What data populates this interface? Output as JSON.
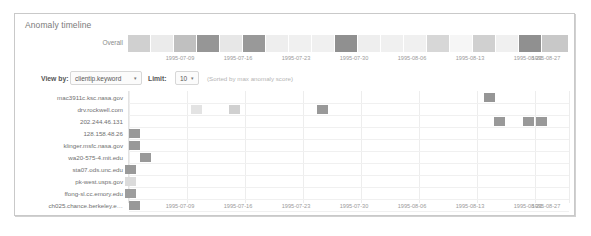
{
  "panel": {
    "title": "Anomaly timeline"
  },
  "overall": {
    "label": "Overall",
    "cells": [
      {
        "x": 0,
        "w": 22,
        "v": 0.22
      },
      {
        "x": 23,
        "w": 22,
        "v": 0.08
      },
      {
        "x": 46,
        "w": 22,
        "v": 0.3
      },
      {
        "x": 69,
        "w": 22,
        "v": 0.52
      },
      {
        "x": 92,
        "w": 22,
        "v": 0.1
      },
      {
        "x": 115,
        "w": 22,
        "v": 0.5
      },
      {
        "x": 138,
        "w": 22,
        "v": 0.06
      },
      {
        "x": 161,
        "w": 22,
        "v": 0.05
      },
      {
        "x": 184,
        "w": 22,
        "v": 0.05
      },
      {
        "x": 207,
        "w": 22,
        "v": 0.55
      },
      {
        "x": 230,
        "w": 22,
        "v": 0.06
      },
      {
        "x": 253,
        "w": 22,
        "v": 0.05
      },
      {
        "x": 276,
        "w": 22,
        "v": 0.05
      },
      {
        "x": 299,
        "w": 22,
        "v": 0.18
      },
      {
        "x": 322,
        "w": 22,
        "v": 0.02
      },
      {
        "x": 345,
        "w": 22,
        "v": 0.22
      },
      {
        "x": 368,
        "w": 22,
        "v": 0.05
      },
      {
        "x": 391,
        "w": 22,
        "v": 0.55
      },
      {
        "x": 414,
        "w": 26,
        "v": 0.26
      }
    ]
  },
  "axis": {
    "top_ticks": [
      {
        "label": "1995-07-09",
        "x": 52
      },
      {
        "label": "1995-07-16",
        "x": 110
      },
      {
        "label": "1995-07-23",
        "x": 168
      },
      {
        "label": "1995-07-30",
        "x": 226
      },
      {
        "label": "1995-08-06",
        "x": 284
      },
      {
        "label": "1995-08-13",
        "x": 342
      },
      {
        "label": "1995-08-20",
        "x": 400
      },
      {
        "label": "1995-08-27",
        "x": 418
      }
    ],
    "bottom_ticks": [
      {
        "label": "1995-07-09",
        "x": 52
      },
      {
        "label": "1995-07-16",
        "x": 110
      },
      {
        "label": "1995-07-23",
        "x": 168
      },
      {
        "label": "1995-07-30",
        "x": 226
      },
      {
        "label": "1995-08-06",
        "x": 284
      },
      {
        "label": "1995-08-13",
        "x": 342
      },
      {
        "label": "1995-08-20",
        "x": 400
      },
      {
        "label": "1995-08-27",
        "x": 418
      }
    ]
  },
  "controls": {
    "view_by_label": "View by:",
    "view_by_value": "clientip.keyword",
    "limit_label": "Limit:",
    "limit_value": "10",
    "caret": "▾",
    "hint": "(Sorted by max anomaly score)"
  },
  "heatmap": {
    "rows": [
      {
        "label": "mac3911c.ksc.nasa.gov",
        "y": 2,
        "cells": [
          {
            "x": 355,
            "v": 0.52
          }
        ]
      },
      {
        "label": "drv.rockwell.com",
        "y": 14,
        "cells": [
          {
            "x": 62,
            "v": 0.12
          },
          {
            "x": 100,
            "v": 0.22
          },
          {
            "x": 188,
            "v": 0.5
          }
        ]
      },
      {
        "label": "202.244.46.131",
        "y": 26,
        "cells": [
          {
            "x": 365,
            "v": 0.5
          },
          {
            "x": 394,
            "v": 0.5
          },
          {
            "x": 407,
            "v": 0.5
          }
        ]
      },
      {
        "label": "128.158.48.26",
        "y": 38,
        "cells": [
          {
            "x": 0,
            "v": 0.5
          }
        ]
      },
      {
        "label": "klinger.msfc.nasa.gov",
        "y": 50,
        "cells": [
          {
            "x": 0,
            "v": 0.5
          }
        ]
      },
      {
        "label": "wa20-575-4.mit.edu",
        "y": 62,
        "cells": [
          {
            "x": 11,
            "v": 0.5
          }
        ]
      },
      {
        "label": "sta07.ods.unc.edu",
        "y": 74,
        "cells": [
          {
            "x": -4,
            "v": 0.5
          }
        ]
      },
      {
        "label": "pk-west.usps.gov",
        "y": 86,
        "cells": [
          {
            "x": -4,
            "v": 0.16
          }
        ]
      },
      {
        "label": "ffong-sl.cc.emory.edu",
        "y": 98,
        "cells": [
          {
            "x": -4,
            "v": 0.48
          }
        ]
      },
      {
        "label": "ch025.chance.berkeley.e…",
        "y": 110,
        "cells": [
          {
            "x": 0,
            "v": 0.5
          }
        ]
      }
    ],
    "gridlines_x": [
      0,
      58,
      116,
      174,
      232,
      290,
      348,
      406,
      440
    ],
    "colors": {
      "low": "#f7f7f7",
      "mid": "#c9c9c9",
      "high": "#8a8a8a",
      "grid": "#ededed"
    }
  }
}
